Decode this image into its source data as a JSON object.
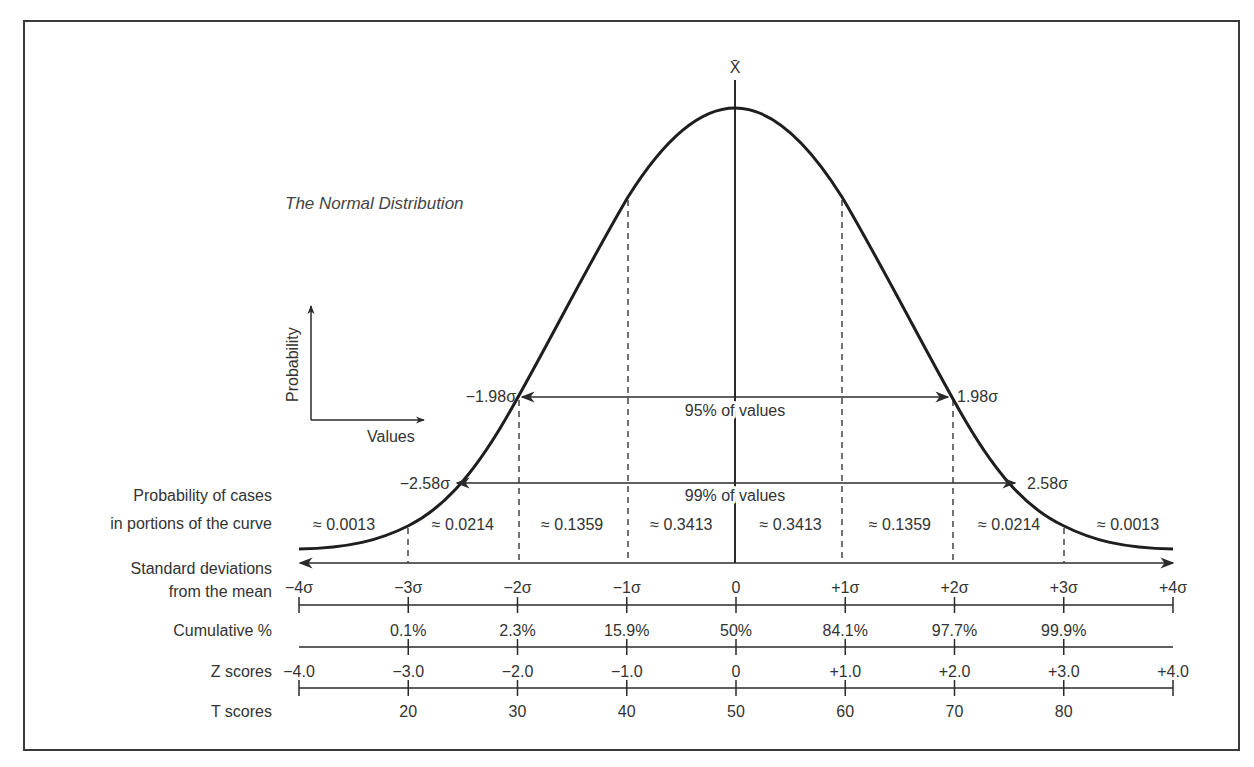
{
  "title": "The Normal Distribution",
  "mean_symbol": "X̄",
  "inset_axes": {
    "y_label": "Probability",
    "x_label": "Values"
  },
  "intervals": {
    "ci95": {
      "label": "95% of values",
      "left": "−1.98σ",
      "right": "1.98σ"
    },
    "ci99": {
      "label": "99% of values",
      "left": "−2.58σ",
      "right": "2.58σ"
    }
  },
  "row_labels": {
    "probability": [
      "Probability of cases",
      "in portions of the curve"
    ],
    "std_dev": [
      "Standard deviations",
      "from the mean"
    ],
    "cumulative": "Cumulative %",
    "z": "Z scores",
    "t": "T scores"
  },
  "colors": {
    "ink": "#2a2a2a",
    "frame": "#3a3a3a",
    "background": "#ffffff"
  },
  "chart_data": {
    "type": "line",
    "title": "The Normal Distribution",
    "xlabel": "Standard deviations from the mean",
    "ylabel": "Probability",
    "x": [
      -4,
      -3,
      -2,
      -1,
      0,
      1,
      2,
      3,
      4
    ],
    "std_dev_ticks": [
      "−4σ",
      "−3σ",
      "−2σ",
      "−1σ",
      "0",
      "+1σ",
      "+2σ",
      "+3σ",
      "+4σ"
    ],
    "probability_portions": [
      "≈ 0.0013",
      "≈ 0.0214",
      "≈ 0.1359",
      "≈ 0.3413",
      "≈ 0.3413",
      "≈ 0.1359",
      "≈ 0.0214",
      "≈ 0.0013"
    ],
    "cumulative_percent": [
      "",
      "0.1%",
      "2.3%",
      "15.9%",
      "50%",
      "84.1%",
      "97.7%",
      "99.9%",
      ""
    ],
    "z_scores": [
      "−4.0",
      "−3.0",
      "−2.0",
      "−1.0",
      "0",
      "+1.0",
      "+2.0",
      "+3.0",
      "+4.0"
    ],
    "t_scores": [
      "",
      "20",
      "30",
      "40",
      "50",
      "60",
      "70",
      "80",
      ""
    ],
    "intervals": [
      {
        "label": "95% of values",
        "from": -1.98,
        "to": 1.98
      },
      {
        "label": "99% of values",
        "from": -2.58,
        "to": 2.58
      }
    ]
  }
}
